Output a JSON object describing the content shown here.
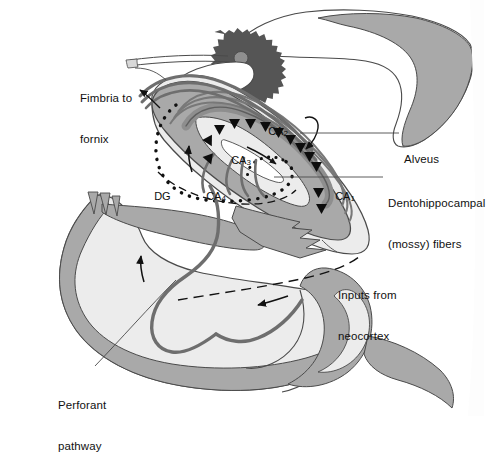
{
  "figure": {
    "palette": {
      "white": "#ffffff",
      "pale_gray": "#ececec",
      "light_gray": "#e0e0e0",
      "mid_gray": "#a9a9a9",
      "gray_band": "#b2b2b2",
      "dark_gray_tract": "#6e6e6e",
      "choroid_plexus": "#555555",
      "outline": "#4a4a4a",
      "ink": "#111111"
    }
  },
  "callouts": [
    {
      "id": "fimbria",
      "name": "fimbria-to-fornix",
      "text": "Fimbria to\nfornix",
      "line1": "Fimbria to",
      "line2": "fornix",
      "x": 80,
      "y": 65,
      "align": "left"
    },
    {
      "id": "alveus",
      "name": "alveus",
      "text": "Alveus",
      "line1": "Alveus",
      "line2": "",
      "x": 404,
      "y": 130,
      "align": "left"
    },
    {
      "id": "mossy",
      "name": "dentohippocampal-mossy-fibers",
      "text": "Dentohippocampal\n(mossy) fibers",
      "line1": "Dentohippocampal",
      "line2": "(mossy) fibers",
      "x": 388,
      "y": 170,
      "align": "left"
    },
    {
      "id": "inputs",
      "name": "inputs-from-neocortex",
      "text": "Inputs from\nneocortex",
      "line1": "Inputs from",
      "line2": "neocortex",
      "x": 338,
      "y": 262,
      "align": "left"
    },
    {
      "id": "perforant",
      "name": "perforant-pathway",
      "text": "Perforant\npathway",
      "line1": "Perforant",
      "line2": "pathway",
      "x": 58,
      "y": 372,
      "align": "left"
    }
  ],
  "regions": [
    {
      "id": "ca1",
      "name": "region-ca1",
      "base": "CA",
      "sub": "1",
      "x": 329,
      "y": 178
    },
    {
      "id": "ca2",
      "name": "region-ca2",
      "base": "CA",
      "sub": "2",
      "x": 262,
      "y": 113
    },
    {
      "id": "ca3",
      "name": "region-ca3",
      "base": "CA",
      "sub": "3",
      "x": 225,
      "y": 142
    },
    {
      "id": "ca4",
      "name": "region-ca4",
      "base": "CA",
      "sub": "4",
      "x": 200,
      "y": 178
    },
    {
      "id": "dg",
      "name": "region-dentate-gyrus",
      "base": "DG",
      "sub": "",
      "x": 148,
      "y": 178
    }
  ],
  "annotations": {
    "choroid_plexus": "choroid-plexus",
    "dentate_dotted_outline": "dentate-gyrus-dotted-outline",
    "schaffer_arrowheads_count": 13,
    "flow_arrows": [
      "fimbria-outflow-arrow",
      "ca3-to-ca1-arrow",
      "dentate-inflow-arrow",
      "perforant-ascending-arrow",
      "entorhinal-leftward-arrow",
      "alveus-hook-arrow"
    ]
  }
}
